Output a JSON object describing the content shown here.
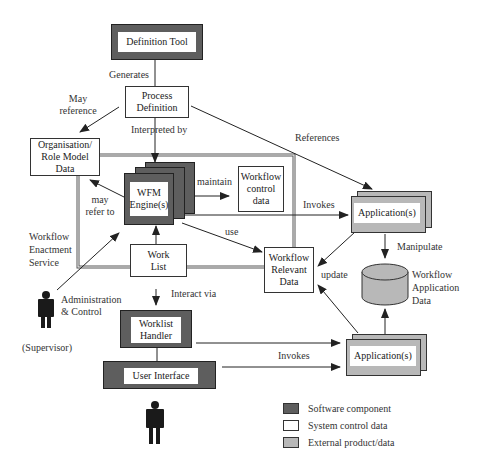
{
  "diagram": {
    "nodes": {
      "definition_tool": "Definition Tool",
      "process_definition": "Process Definition",
      "org_role_model": "Organisation/ Role Model Data",
      "wfm_engine": "WFM Engine(s)",
      "workflow_control_data": "Workflow control data",
      "work_list": "Work List",
      "workflow_relevant_data": "Workflow Relevant Data",
      "application_top": "Application(s)",
      "application_bottom": "Application(s)",
      "workflow_application_data": "Workflow Application Data",
      "worklist_handler": "Worklist Handler",
      "user_interface": "User Interface",
      "enactment_service": "Workflow Enactment Service",
      "supervisor": "(Supervisor)"
    },
    "edges": {
      "generates": "Generates",
      "may_reference": "May reference",
      "interpreted_by": "Interpreted by",
      "references": "References",
      "maintain": "maintain",
      "may_refer_to": "may refer to",
      "invokes_top": "Invokes",
      "use": "use",
      "manipulate": "Manipulate",
      "update": "update",
      "interact_via": "Interact via",
      "administration_control": "Administration & Control",
      "invokes_bottom": "Invokes"
    },
    "legend": [
      {
        "label": "Software component",
        "color": "#5e5e5e"
      },
      {
        "label": "System control data",
        "color": "#ffffff"
      },
      {
        "label": "External product/data",
        "color": "#b8b8b8"
      }
    ]
  }
}
